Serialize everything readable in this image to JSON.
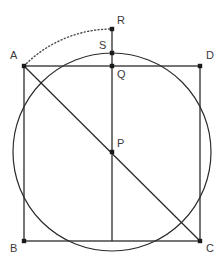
{
  "figure": {
    "name": "square-with-circumscribed-circle-and-arc",
    "width": 224,
    "height": 273,
    "background": "#ffffff",
    "stroke_color": "#2b2b2b",
    "label_color": "#3a3a3a",
    "point_color": "#1a1a1a"
  },
  "points": [
    {
      "id": "A",
      "label": "A",
      "x": 24,
      "y": 66,
      "label_x": 10,
      "label_y": 50,
      "dot": true
    },
    {
      "id": "D",
      "label": "D",
      "x": 200,
      "y": 66,
      "label_x": 206,
      "label_y": 50,
      "dot": true
    },
    {
      "id": "B",
      "label": "B",
      "x": 24,
      "y": 241,
      "label_x": 10,
      "label_y": 243,
      "dot": true
    },
    {
      "id": "C",
      "label": "C",
      "x": 200,
      "y": 241,
      "label_x": 206,
      "label_y": 243,
      "dot": true
    },
    {
      "id": "P",
      "label": "P",
      "x": 112,
      "y": 152,
      "label_x": 117,
      "label_y": 138,
      "dot": true
    },
    {
      "id": "Q",
      "label": "Q",
      "x": 112,
      "y": 66,
      "label_x": 117,
      "label_y": 69,
      "dot": true
    },
    {
      "id": "S",
      "label": "S",
      "x": 112,
      "y": 53,
      "label_x": 99,
      "label_y": 40,
      "dot": true
    },
    {
      "id": "R",
      "label": "R",
      "x": 112,
      "y": 29,
      "label_x": 117,
      "label_y": 15,
      "dot": true
    }
  ],
  "square": {
    "name": "square-ABCD",
    "vertices": "A,D,C,B",
    "left": 24,
    "top": 66,
    "right": 200,
    "bottom": 241,
    "side_px": 176
  },
  "circle": {
    "name": "circumscribed-circle",
    "center_id": "P",
    "cx": 112,
    "cy": 152,
    "radius": 99,
    "top_point": "S",
    "fill": "none"
  },
  "segments": [
    {
      "name": "side-AD",
      "from": "A",
      "to": "D",
      "style": "solid"
    },
    {
      "name": "side-DC",
      "from": "D",
      "to": "C",
      "style": "solid"
    },
    {
      "name": "side-CB",
      "from": "C",
      "to": "B",
      "style": "solid"
    },
    {
      "name": "side-BA",
      "from": "B",
      "to": "A",
      "style": "solid"
    },
    {
      "name": "diagonal-AC",
      "from": "A",
      "to": "C",
      "style": "solid"
    },
    {
      "name": "vertical-RP-to-bottom",
      "from": "R",
      "to": "bottom-edge",
      "x": 112,
      "y1": 29,
      "y2": 241,
      "style": "solid"
    }
  ],
  "arc": {
    "name": "dotted-arc-A-to-R",
    "from": "A",
    "to": "R",
    "center_id": "P",
    "radius": 123,
    "style": "dotted",
    "description": "arc centered at P from A up to R"
  }
}
